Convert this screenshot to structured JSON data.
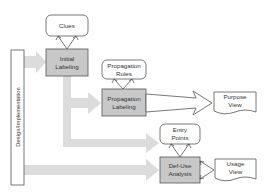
{
  "diagram": {
    "side_bar": {
      "label": "Design/Implementation"
    },
    "nodes": {
      "clues": {
        "label": "Clues"
      },
      "initial_labeling": {
        "label": "Initial\nLabeling"
      },
      "propagation_rules": {
        "label": "Propagation\nRules"
      },
      "propagation_labeling": {
        "label": "Propagation\nLabeling"
      },
      "purpose_view": {
        "label": "Purpose\nView"
      },
      "entry_points": {
        "label": "Entry\nPoints"
      },
      "def_use_analysis": {
        "label": "Def-Use\nAnalysis"
      },
      "usage_view": {
        "label": "Usage\nView"
      }
    },
    "colors": {
      "process_fill": "#c8c8c8",
      "flow_arrow": "#d9d9d9",
      "stroke": "#555555"
    }
  }
}
